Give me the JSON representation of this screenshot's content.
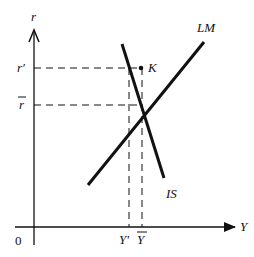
{
  "diagram": {
    "type": "IS-LM model",
    "axes": {
      "y_label": "r",
      "x_label": "Y",
      "origin_label": "0"
    },
    "curves": {
      "lm_label": "LM",
      "is_label": "IS"
    },
    "point_label": "K",
    "y_ticks": {
      "r_prime": "r′",
      "r_bar": "r"
    },
    "x_ticks": {
      "y_prime": "Y′",
      "y_bar": "Y"
    },
    "colors": {
      "ink": "#111111",
      "background": "#ffffff"
    }
  }
}
